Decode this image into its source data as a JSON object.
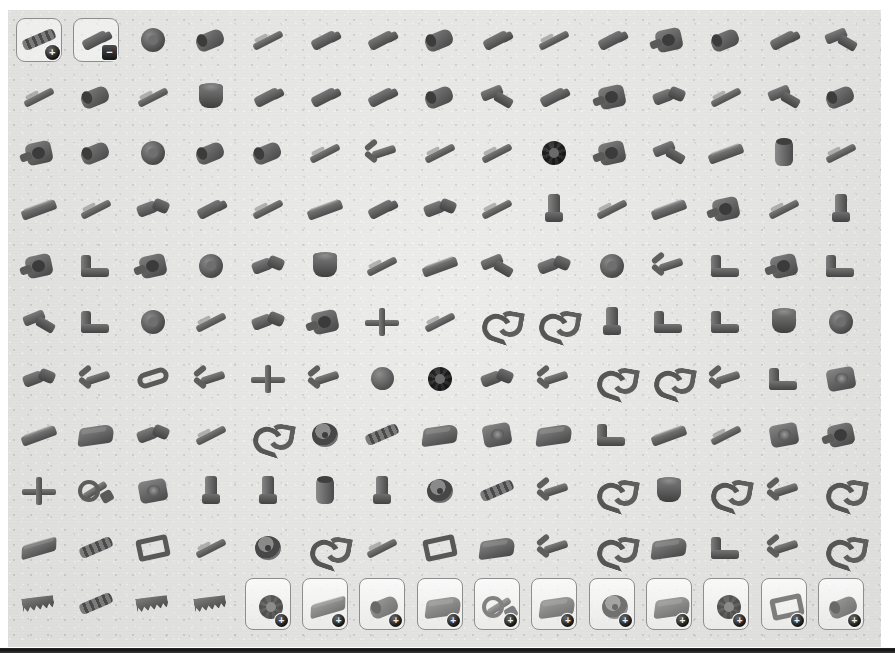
{
  "app": {
    "title": "Parts Palette",
    "background_color": "#ffffff",
    "panel_color": "#e9e9e7",
    "part_color": "#5f5f5f",
    "frame_border_color": "#8d8d8d",
    "badge_color": "#141414"
  },
  "palette": {
    "columns": 15,
    "rows": 11,
    "badges": {
      "plus": "+",
      "minus": "−"
    },
    "cells": [
      {
        "name": "part-axle-connector-block",
        "shape": "s-chain",
        "framed": true,
        "badge": "plus"
      },
      {
        "name": "part-axle-pin-connector",
        "shape": "s-pin",
        "framed": true,
        "badge": "minus"
      },
      {
        "name": "part-wheel-hub",
        "shape": "s-wheel"
      },
      {
        "name": "part-connector-peg-long",
        "shape": "s-tube"
      },
      {
        "name": "part-axle-2l",
        "shape": "s-rod"
      },
      {
        "name": "part-pin-3l",
        "shape": "s-pin"
      },
      {
        "name": "part-pin-with-stud",
        "shape": "s-pin"
      },
      {
        "name": "part-connector-round",
        "shape": "s-tube"
      },
      {
        "name": "part-axle-pin",
        "shape": "s-pin"
      },
      {
        "name": "part-axle-4l",
        "shape": "s-rod"
      },
      {
        "name": "part-pin-connector",
        "shape": "s-pin"
      },
      {
        "name": "part-bush-with-flange",
        "shape": "s-hub"
      },
      {
        "name": "part-axle-extender",
        "shape": "s-tube"
      },
      {
        "name": "part-pin-friction",
        "shape": "s-pin"
      },
      {
        "name": "part-ball-joint-pin",
        "shape": "s-angle"
      },
      {
        "name": "part-axle-6l",
        "shape": "s-rod"
      },
      {
        "name": "part-connector-sleeve",
        "shape": "s-tube"
      },
      {
        "name": "part-axle-3l",
        "shape": "s-rod"
      },
      {
        "name": "part-tyre-small",
        "shape": "s-cup"
      },
      {
        "name": "part-pin-half",
        "shape": "s-pin"
      },
      {
        "name": "part-pin-long",
        "shape": "s-pin"
      },
      {
        "name": "part-axle-pin-3l",
        "shape": "s-pin"
      },
      {
        "name": "part-connector-block",
        "shape": "s-tube"
      },
      {
        "name": "part-elbow-connector",
        "shape": "s-angle"
      },
      {
        "name": "part-pin-joiner",
        "shape": "s-pin"
      },
      {
        "name": "part-hub-round",
        "shape": "s-hub"
      },
      {
        "name": "part-double-connector",
        "shape": "s-axleconn"
      },
      {
        "name": "part-axle-8l",
        "shape": "s-rod"
      },
      {
        "name": "part-angled-connector",
        "shape": "s-angle"
      },
      {
        "name": "part-cylinder-block",
        "shape": "s-tube"
      },
      {
        "name": "part-steering-knuckle",
        "shape": "s-hub"
      },
      {
        "name": "part-wheel-rim",
        "shape": "s-tube"
      },
      {
        "name": "part-tyre-large",
        "shape": "s-wheel"
      },
      {
        "name": "part-hub-wide",
        "shape": "s-tube"
      },
      {
        "name": "part-connector-round-2",
        "shape": "s-tube"
      },
      {
        "name": "part-axle-5l",
        "shape": "s-rod"
      },
      {
        "name": "part-ball-socket",
        "shape": "s-fork"
      },
      {
        "name": "part-axle-7l",
        "shape": "s-rod"
      },
      {
        "name": "part-axle-9l",
        "shape": "s-rod"
      },
      {
        "name": "part-gear-24t",
        "shape": "s-gear"
      },
      {
        "name": "part-gear-housing",
        "shape": "s-hub"
      },
      {
        "name": "part-elbow-3x3",
        "shape": "s-angle"
      },
      {
        "name": "part-beam-long",
        "shape": "s-beam"
      },
      {
        "name": "part-bushing-tall",
        "shape": "s-bushing"
      },
      {
        "name": "part-axle-10l",
        "shape": "s-rod"
      },
      {
        "name": "part-liftarm-2l",
        "shape": "s-beam"
      },
      {
        "name": "part-axle-12l",
        "shape": "s-rod"
      },
      {
        "name": "part-frame-connector",
        "shape": "s-axleconn"
      },
      {
        "name": "part-axle-with-stop",
        "shape": "s-pin"
      },
      {
        "name": "part-axle-short",
        "shape": "s-rod"
      },
      {
        "name": "part-beam-angled",
        "shape": "s-beam"
      },
      {
        "name": "part-pin-double",
        "shape": "s-pin"
      },
      {
        "name": "part-axle-joiner",
        "shape": "s-axleconn"
      },
      {
        "name": "part-axle-11l",
        "shape": "s-rod"
      },
      {
        "name": "part-bush-stud",
        "shape": "s-stud"
      },
      {
        "name": "part-rod-thin",
        "shape": "s-rod"
      },
      {
        "name": "part-beam-3l",
        "shape": "s-beam"
      },
      {
        "name": "part-connector-pin-hub",
        "shape": "s-hub"
      },
      {
        "name": "part-axle-13l",
        "shape": "s-rod"
      },
      {
        "name": "part-stud-connector",
        "shape": "s-stud"
      },
      {
        "name": "part-hub-connector",
        "shape": "s-hub"
      },
      {
        "name": "part-cluster-block",
        "shape": "s-bracket"
      },
      {
        "name": "part-hinge-block",
        "shape": "s-hub"
      },
      {
        "name": "part-ring-hub",
        "shape": "s-wheel"
      },
      {
        "name": "part-dual-joint",
        "shape": "s-axleconn"
      },
      {
        "name": "part-cup-hub",
        "shape": "s-cup"
      },
      {
        "name": "part-axle-14l",
        "shape": "s-rod"
      },
      {
        "name": "part-beam-4l",
        "shape": "s-beam"
      },
      {
        "name": "part-clip-piece",
        "shape": "s-angle"
      },
      {
        "name": "part-double-pin",
        "shape": "s-axleconn"
      },
      {
        "name": "part-wheel-small",
        "shape": "s-wheel"
      },
      {
        "name": "part-tri-joint",
        "shape": "s-fork"
      },
      {
        "name": "part-bracket-angled",
        "shape": "s-bracket"
      },
      {
        "name": "part-hub-spoke",
        "shape": "s-hub"
      },
      {
        "name": "part-cluster-small",
        "shape": "s-bracket"
      },
      {
        "name": "part-angle-piece",
        "shape": "s-angle"
      },
      {
        "name": "part-tower-block",
        "shape": "s-bracket"
      },
      {
        "name": "part-wheel-hub-2",
        "shape": "s-wheel"
      },
      {
        "name": "part-axle-15l",
        "shape": "s-rod"
      },
      {
        "name": "part-joint-piece",
        "shape": "s-axleconn"
      },
      {
        "name": "part-hub-side",
        "shape": "s-hub"
      },
      {
        "name": "part-joiner-cross",
        "shape": "s-cross"
      },
      {
        "name": "part-axle-16l",
        "shape": "s-rod"
      },
      {
        "name": "part-hook-double",
        "shape": "s-hook"
      },
      {
        "name": "part-hook-single",
        "shape": "s-hook"
      },
      {
        "name": "part-pin-tall",
        "shape": "s-stud"
      },
      {
        "name": "part-joint-tall",
        "shape": "s-bracket"
      },
      {
        "name": "part-block-side",
        "shape": "s-bracket"
      },
      {
        "name": "part-hub-deep",
        "shape": "s-cup"
      },
      {
        "name": "part-ring-large",
        "shape": "s-wheel"
      },
      {
        "name": "part-link-arm",
        "shape": "s-axleconn"
      },
      {
        "name": "part-claw",
        "shape": "s-fork"
      },
      {
        "name": "part-link-long",
        "shape": "s-link"
      },
      {
        "name": "part-fork-joint",
        "shape": "s-fork"
      },
      {
        "name": "part-cross-joint",
        "shape": "s-cross"
      },
      {
        "name": "part-u-joint",
        "shape": "s-fork"
      },
      {
        "name": "part-ball-large",
        "shape": "s-ball"
      },
      {
        "name": "part-gear-bevel",
        "shape": "s-gear"
      },
      {
        "name": "part-crank-arm",
        "shape": "s-axleconn"
      },
      {
        "name": "part-fork-wide",
        "shape": "s-fork"
      },
      {
        "name": "part-clip-arm",
        "shape": "s-hook"
      },
      {
        "name": "part-curved-arm",
        "shape": "s-hook"
      },
      {
        "name": "part-joint-piece-2",
        "shape": "s-fork"
      },
      {
        "name": "part-bracket-wide",
        "shape": "s-bracket"
      },
      {
        "name": "part-pulley",
        "shape": "s-turntable"
      },
      {
        "name": "part-beam-thick",
        "shape": "s-beam"
      },
      {
        "name": "part-panel-small",
        "shape": "s-panel"
      },
      {
        "name": "part-gun-piece",
        "shape": "s-axleconn"
      },
      {
        "name": "part-needle",
        "shape": "s-rod"
      },
      {
        "name": "part-hook-arm",
        "shape": "s-hook"
      },
      {
        "name": "part-steering-wheel",
        "shape": "s-steer"
      },
      {
        "name": "part-flex-tube",
        "shape": "s-chain"
      },
      {
        "name": "part-engine-block",
        "shape": "s-panel"
      },
      {
        "name": "part-gearbox",
        "shape": "s-turntable"
      },
      {
        "name": "part-plate-engine",
        "shape": "s-panel"
      },
      {
        "name": "part-mount-block",
        "shape": "s-bracket"
      },
      {
        "name": "part-arm-long",
        "shape": "s-beam"
      },
      {
        "name": "part-axle-17l",
        "shape": "s-rod"
      },
      {
        "name": "part-turntable",
        "shape": "s-turntable"
      },
      {
        "name": "part-hub-ring-2",
        "shape": "s-hub"
      },
      {
        "name": "part-propeller-hub",
        "shape": "s-cross"
      },
      {
        "name": "part-wrench-arm",
        "shape": "s-wrench"
      },
      {
        "name": "part-cam",
        "shape": "s-turntable"
      },
      {
        "name": "part-pin-vertical",
        "shape": "s-stud"
      },
      {
        "name": "part-shaft-vertical",
        "shape": "s-stud"
      },
      {
        "name": "part-rod-vertical",
        "shape": "s-bushing"
      },
      {
        "name": "part-shaft-vertical-2",
        "shape": "s-stud"
      },
      {
        "name": "part-steering-wheel-2",
        "shape": "s-steer"
      },
      {
        "name": "part-flex-rod",
        "shape": "s-chain"
      },
      {
        "name": "part-pin-joint",
        "shape": "s-fork"
      },
      {
        "name": "part-hook-small",
        "shape": "s-hook"
      },
      {
        "name": "part-dome",
        "shape": "s-cup"
      },
      {
        "name": "part-clip-small",
        "shape": "s-hook"
      },
      {
        "name": "part-fork-small",
        "shape": "s-fork"
      },
      {
        "name": "part-claw-small",
        "shape": "s-hook"
      },
      {
        "name": "part-plate-long",
        "shape": "s-plate"
      },
      {
        "name": "part-track-link",
        "shape": "s-chain"
      },
      {
        "name": "part-frame-square",
        "shape": "s-frame"
      },
      {
        "name": "part-blade",
        "shape": "s-rod"
      },
      {
        "name": "part-steering-wheel-3",
        "shape": "s-steer"
      },
      {
        "name": "part-hook-end",
        "shape": "s-hook"
      },
      {
        "name": "part-needle-long",
        "shape": "s-rod"
      },
      {
        "name": "part-arch-piece",
        "shape": "s-frame"
      },
      {
        "name": "part-panel-wedge",
        "shape": "s-panel"
      },
      {
        "name": "part-joint-wedge",
        "shape": "s-fork"
      },
      {
        "name": "part-arm-bent",
        "shape": "s-hook"
      },
      {
        "name": "part-panel-curved",
        "shape": "s-panel"
      },
      {
        "name": "part-cluster-wide",
        "shape": "s-bracket"
      },
      {
        "name": "part-fork-arm",
        "shape": "s-fork"
      },
      {
        "name": "part-claw-wide",
        "shape": "s-hook"
      },
      {
        "name": "part-saw-blade-1",
        "shape": "s-saw"
      },
      {
        "name": "part-drill-bit",
        "shape": "s-chain"
      },
      {
        "name": "part-saw-blade-2",
        "shape": "s-saw"
      },
      {
        "name": "part-saw-blade-3",
        "shape": "s-saw"
      }
    ],
    "category_buttons": [
      {
        "name": "category-gears",
        "shape": "s-gear",
        "badge": "plus"
      },
      {
        "name": "category-vehicles",
        "shape": "s-plate",
        "badge": "plus"
      },
      {
        "name": "category-cylinders",
        "shape": "s-tube",
        "badge": "plus"
      },
      {
        "name": "category-plates",
        "shape": "s-panel",
        "badge": "plus"
      },
      {
        "name": "category-tools",
        "shape": "s-wrench",
        "badge": "plus"
      },
      {
        "name": "category-wedges",
        "shape": "s-panel",
        "badge": "plus"
      },
      {
        "name": "category-wheels",
        "shape": "s-steer",
        "badge": "plus"
      },
      {
        "name": "category-decorative",
        "shape": "s-panel",
        "badge": "plus"
      },
      {
        "name": "category-sprockets",
        "shape": "s-gear",
        "badge": "plus"
      },
      {
        "name": "category-frames",
        "shape": "s-frame",
        "badge": "plus"
      },
      {
        "name": "category-connectors",
        "shape": "s-tube",
        "badge": "plus"
      }
    ]
  }
}
